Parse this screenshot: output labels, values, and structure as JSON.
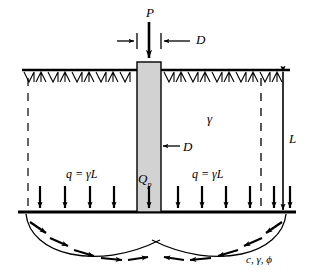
{
  "figure": {
    "labels": {
      "applied_load": "P",
      "diameter_top": "D",
      "diameter_mid": "D",
      "unit_weight": "γ",
      "embedment_depth": "L",
      "surcharge_left": "q = γL",
      "surcharge_right": "q = γL",
      "point_resistance_symbol": "Q",
      "point_resistance_subscript": "p",
      "soil_parameters": "c, γ, ϕ"
    },
    "colors": {
      "pile_fill": "#d2d2d2",
      "pile_stroke": "#000000",
      "line": "#000000",
      "background": "#ffffff"
    },
    "geometry": {
      "ground_surface_y": 70,
      "base_line_y": 212,
      "pile_left_x": 137,
      "pile_right_x": 161,
      "pile_top_y": 62,
      "pile_bottom_y": 212,
      "embedment_length_px": 142,
      "surcharge_arrow_count": 11,
      "failure_arc_count": 2
    }
  }
}
